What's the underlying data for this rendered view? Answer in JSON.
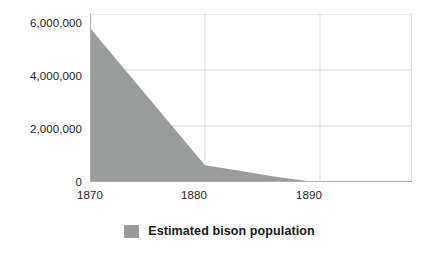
{
  "chart_data": {
    "type": "area",
    "title": "",
    "subtitle": "",
    "xlabel": "",
    "ylabel": "",
    "xlim": [
      1870,
      1898
    ],
    "ylim": [
      0,
      6000000
    ],
    "grid": true,
    "legend_position": "bottom-center",
    "x_ticks": [
      "1870",
      "1880",
      "1890"
    ],
    "x_tick_values": [
      1870,
      1880,
      1890
    ],
    "y_ticks": [
      "0",
      "2,000,000",
      "4,000,000",
      "6,000,000"
    ],
    "y_tick_values": [
      0,
      2000000,
      4000000,
      6000000
    ],
    "series": [
      {
        "name": "Estimated bison population",
        "color": "#9a9b9b",
        "x": [
          1870,
          1880,
          1883,
          1886,
          1889,
          1898
        ],
        "values": [
          5500000,
          600000,
          400000,
          200000,
          30000,
          10000
        ]
      }
    ],
    "legend": [
      {
        "label": "Estimated bison population",
        "color": "#9a9b9b",
        "swatch": "square-swatch"
      }
    ],
    "colors": {
      "area_fill": "#9a9b9b",
      "gridline": "#d8d8d8",
      "axis_line": "#b8b8b8",
      "text": "#1d1d1d",
      "background": "#ffffff"
    }
  }
}
